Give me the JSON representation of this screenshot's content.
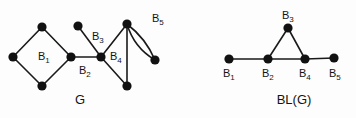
{
  "figure": {
    "background_color": "#fdfdfd",
    "node_color": "#111111",
    "edge_color": "#1a1a1a"
  },
  "panels": [
    {
      "id": "graph-g",
      "caption": "G",
      "caption_pos": {
        "x": 80,
        "y": 104
      },
      "nodes": [
        {
          "id": "g1",
          "x": 13,
          "y": 57,
          "r": 4.6
        },
        {
          "id": "g2",
          "x": 42,
          "y": 27,
          "r": 4.6
        },
        {
          "id": "g3",
          "x": 42,
          "y": 86,
          "r": 4.6
        },
        {
          "id": "g4",
          "x": 71,
          "y": 57,
          "r": 4.6
        },
        {
          "id": "g5",
          "x": 78,
          "y": 26,
          "r": 4.6
        },
        {
          "id": "g6",
          "x": 101,
          "y": 57,
          "r": 4.6
        },
        {
          "id": "g7",
          "x": 127,
          "y": 24,
          "r": 4.6
        },
        {
          "id": "g8",
          "x": 127,
          "y": 86,
          "r": 4.6
        },
        {
          "id": "g9",
          "x": 155,
          "y": 60,
          "r": 4.6
        }
      ],
      "edges": [
        {
          "from": "g1",
          "to": "g2",
          "block": "B1"
        },
        {
          "from": "g2",
          "to": "g4",
          "block": "B1"
        },
        {
          "from": "g4",
          "to": "g3",
          "block": "B1"
        },
        {
          "from": "g3",
          "to": "g1",
          "block": "B1"
        },
        {
          "from": "g4",
          "to": "g6",
          "block": "B2"
        },
        {
          "from": "g5",
          "to": "g6",
          "block": "B3"
        },
        {
          "from": "g6",
          "to": "g7",
          "block": "B4"
        },
        {
          "from": "g7",
          "to": "g8",
          "block": "B4"
        },
        {
          "from": "g8",
          "to": "g6",
          "block": "B4"
        }
      ],
      "curved_edges": [
        {
          "from": "g7",
          "to": "g9",
          "block": "B5",
          "bow": 9
        },
        {
          "from": "g7",
          "to": "g9",
          "block": "B5",
          "bow": -6
        }
      ],
      "labels": [
        {
          "base": "B",
          "sub": "1",
          "x": 38,
          "y": 60
        },
        {
          "base": "B",
          "sub": "2",
          "x": 79,
          "y": 74
        },
        {
          "base": "B",
          "sub": "3",
          "x": 92,
          "y": 40
        },
        {
          "base": "B",
          "sub": "4",
          "x": 110,
          "y": 60
        },
        {
          "base": "B",
          "sub": "5",
          "x": 152,
          "y": 22
        }
      ]
    },
    {
      "id": "block-line-graph",
      "caption": "BL(G)",
      "caption_pos": {
        "x": 294,
        "y": 104
      },
      "nodes": [
        {
          "id": "b1",
          "x": 229,
          "y": 59,
          "r": 4.6
        },
        {
          "id": "b2",
          "x": 268,
          "y": 59,
          "r": 4.6
        },
        {
          "id": "b3",
          "x": 288,
          "y": 28,
          "r": 4.6
        },
        {
          "id": "b4",
          "x": 305,
          "y": 59,
          "r": 4.6
        },
        {
          "id": "b5",
          "x": 334,
          "y": 58,
          "r": 4.6
        }
      ],
      "edges": [
        {
          "from": "b1",
          "to": "b2",
          "block": "B1-B2"
        },
        {
          "from": "b2",
          "to": "b3",
          "block": "B2-B3"
        },
        {
          "from": "b3",
          "to": "b4",
          "block": "B3-B4"
        },
        {
          "from": "b2",
          "to": "b4",
          "block": "B2-B4"
        },
        {
          "from": "b4",
          "to": "b5",
          "block": "B4-B5"
        }
      ],
      "curved_edges": [],
      "labels": [
        {
          "base": "B",
          "sub": "1",
          "x": 223,
          "y": 77
        },
        {
          "base": "B",
          "sub": "2",
          "x": 262,
          "y": 77
        },
        {
          "base": "B",
          "sub": "3",
          "x": 282,
          "y": 19
        },
        {
          "base": "B",
          "sub": "4",
          "x": 299,
          "y": 77
        },
        {
          "base": "B",
          "sub": "5",
          "x": 329,
          "y": 77
        }
      ]
    }
  ]
}
